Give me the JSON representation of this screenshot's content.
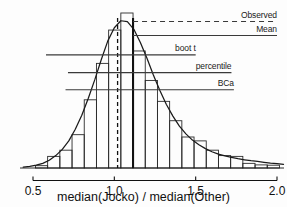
{
  "chart_data": {
    "type": "bar",
    "title": "",
    "subtitle": "",
    "xlabel": "median(Jocko) / median(Other)",
    "ylabel": "",
    "xlim": [
      0.44,
      2.05
    ],
    "ylim": [
      0,
      1.0
    ],
    "grid": false,
    "legend": "none",
    "xticks": [
      0.5,
      1.0,
      1.5,
      2.0
    ],
    "xtick_labels": [
      "0.5",
      "1.0",
      "1.5",
      "2.0"
    ],
    "histogram": {
      "description": "Bootstrap distribution of median(Jocko)/median(Other)",
      "bin_width": 0.075,
      "bin_starts": [
        0.44,
        0.515,
        0.59,
        0.665,
        0.74,
        0.815,
        0.89,
        0.965,
        1.04,
        1.115,
        1.19,
        1.265,
        1.34,
        1.415,
        1.49,
        1.565,
        1.64,
        1.715,
        1.79,
        1.865,
        1.94
      ],
      "values": [
        0.0,
        0.015,
        0.075,
        0.115,
        0.215,
        0.44,
        0.675,
        0.89,
        1.0,
        0.755,
        0.565,
        0.43,
        0.305,
        0.2,
        0.175,
        0.115,
        0.08,
        0.075,
        0.03,
        0.02,
        0.018
      ]
    },
    "density_curve": {
      "description": "smooth normal-like density overlay fitted to the bootstrap histogram",
      "x": [
        0.44,
        0.48,
        0.52,
        0.56,
        0.6,
        0.64,
        0.68,
        0.72,
        0.76,
        0.8,
        0.84,
        0.88,
        0.92,
        0.96,
        1.0,
        1.04,
        1.08,
        1.12,
        1.16,
        1.2,
        1.24,
        1.28,
        1.32,
        1.36,
        1.4,
        1.44,
        1.48,
        1.52,
        1.56,
        1.6,
        1.64,
        1.68,
        1.72,
        1.76,
        1.8,
        1.84,
        1.88,
        1.92,
        1.96,
        2.0,
        2.04
      ],
      "y": [
        0.005,
        0.01,
        0.018,
        0.03,
        0.05,
        0.08,
        0.12,
        0.175,
        0.25,
        0.34,
        0.45,
        0.57,
        0.7,
        0.82,
        0.905,
        0.95,
        0.945,
        0.895,
        0.81,
        0.71,
        0.6,
        0.5,
        0.41,
        0.335,
        0.27,
        0.22,
        0.18,
        0.15,
        0.125,
        0.105,
        0.09,
        0.078,
        0.068,
        0.06,
        0.053,
        0.047,
        0.042,
        0.037,
        0.032,
        0.028,
        0.024
      ]
    },
    "vertical_markers": [
      {
        "name": "bootstrap-mean-marker",
        "x": 1.02,
        "style": "dashed"
      },
      {
        "name": "observed-value-marker",
        "x": 1.115,
        "style": "solid-thick"
      }
    ],
    "intervals": [
      {
        "label": "Observed",
        "name": "observed",
        "y": 0.945,
        "x_start": 1.115,
        "x_end": 2.0,
        "style": "dashed"
      },
      {
        "label": "Mean",
        "name": "mean",
        "y": 0.855,
        "x_start": 1.115,
        "x_end": 2.0,
        "style": "solid"
      },
      {
        "label": "boot t",
        "name": "boot-t",
        "y": 0.73,
        "x_start": 0.58,
        "x_end": 1.5,
        "style": "solid"
      },
      {
        "label": "percentile",
        "name": "percentile",
        "y": 0.615,
        "x_start": 0.715,
        "x_end": 1.72,
        "style": "solid"
      },
      {
        "label": "BCa",
        "name": "bca",
        "y": 0.505,
        "x_start": 0.7,
        "x_end": 1.735,
        "style": "solid"
      }
    ]
  },
  "axis": {
    "title": "median(Jocko) / median(Other)",
    "ticks": [
      "0.5",
      "1.0",
      "1.5",
      "2.0"
    ]
  },
  "labels": {
    "observed": "Observed",
    "mean": "Mean",
    "boot_t": "boot t",
    "percentile": "percentile",
    "bca": "BCa"
  },
  "colors": {
    "ink": "#111111",
    "bar_stroke": "#2b2b2b",
    "curve": "#1a1a1a",
    "interval_line": "#3a3a3a",
    "background": "#fdfdfd"
  }
}
